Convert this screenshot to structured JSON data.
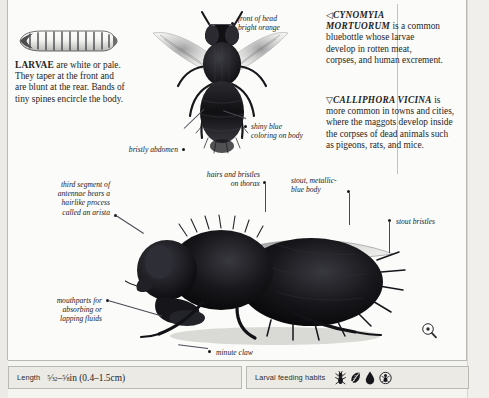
{
  "page": {
    "larva_caption": {
      "lead": "LARVAE",
      "rest": " are white or pale. They taper at the front and are blunt at the rear. Bands of tiny spines encircle the body."
    },
    "species_blocks": [
      {
        "marker": "◁",
        "name": "CYNOMYIA MORTUORUM",
        "text": " is a common bluebottle whose larvae develop in rotten meat, corpses, and human excrement."
      },
      {
        "marker": "▽",
        "name": "CALLIPHORA VICINA",
        "text": " is more common in towns and cities, where the maggots develop inside the corpses of dead animals such as pigeons, rats, and mice."
      }
    ],
    "callouts": [
      {
        "id": "front-of-head",
        "text": "front of head\nbright orange"
      },
      {
        "id": "shiny-blue",
        "text": "shiny blue\ncoloring on body"
      },
      {
        "id": "bristly-abdomen",
        "text": "bristly abdomen"
      },
      {
        "id": "arista",
        "text": "third segment of\nantennae bears a\nhairlike process\ncalled an arista"
      },
      {
        "id": "hairs-bristles",
        "text": "hairs and bristles\non thorax"
      },
      {
        "id": "stout-body",
        "text": "stout, metallic-\nblue body"
      },
      {
        "id": "stout-bristles",
        "text": "stout bristles"
      },
      {
        "id": "mouthparts",
        "text": "mouthparts for\nabsorbing or\nlapping fluids"
      },
      {
        "id": "minute-claw",
        "text": "minute claw"
      }
    ],
    "footer": {
      "length_label": "Length",
      "length_value_whole": "in (0.4–1.5cm)",
      "length_min_num": "5",
      "length_min_den": "32",
      "length_max_num": "5",
      "length_max_den": "8",
      "length_dash": "–",
      "habits_label": "Larval feeding habits",
      "habit_icons": [
        "insect-prey-icon",
        "leaf-icon",
        "blood-droplet-icon",
        "circled-carrion-icon"
      ]
    },
    "colors": {
      "paper": "#fbfbf9",
      "rule": "#b9b9b4",
      "text": "#1f1f1f",
      "callout": "#23232a",
      "footer_fill": "#eceae5"
    }
  }
}
